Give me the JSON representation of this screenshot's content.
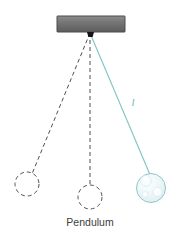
{
  "figure": {
    "caption": "Pendulum",
    "background_color": "#ffffff"
  },
  "support": {
    "name": "support-bar",
    "x": 57,
    "y": 16,
    "width": 68,
    "height": 16,
    "fill_top_color": "#8a8a8a",
    "fill_bottom_color": "#5e5e5e",
    "border_color": "#4d4d4d"
  },
  "pivot": {
    "name": "pivot-point",
    "x": 90,
    "y": 32,
    "width": 7,
    "height": 5,
    "color": "#1a1a1a"
  },
  "strings": {
    "active": {
      "label": "l",
      "color": "#7fc4c4",
      "x1": 90,
      "y1": 33,
      "x2": 151,
      "y2": 178,
      "label_x": 133,
      "label_y": 106
    },
    "ghost_left": {
      "color": "#4f4f4f",
      "dash": "4 3",
      "x1": 90,
      "y1": 33,
      "x2": 32,
      "y2": 174
    },
    "ghost_center": {
      "color": "#4f4f4f",
      "dash": "4 3",
      "x1": 90,
      "y1": 33,
      "x2": 90,
      "y2": 186
    }
  },
  "bobs": {
    "active": {
      "name": "pendulum-bob",
      "cx": 151,
      "cy": 188,
      "r": 14.5,
      "fill_color": "#eaf4f5",
      "stroke_color": "#86c3c6",
      "highlights": [
        {
          "cx": 146,
          "cy": 181,
          "r": 5.5
        },
        {
          "cx": 157,
          "cy": 192,
          "r": 4.5
        },
        {
          "cx": 145,
          "cy": 194,
          "r": 3.0
        }
      ],
      "highlight_color": "#f8fdfd"
    },
    "ghost_left": {
      "name": "pendulum-bob-ghost-left",
      "cx": 27,
      "cy": 184,
      "r": 12,
      "stroke_color": "#555555",
      "dash": "4 3"
    },
    "ghost_center": {
      "name": "pendulum-bob-ghost-center",
      "cx": 90,
      "cy": 197,
      "r": 12,
      "stroke_color": "#555555",
      "dash": "4 3"
    }
  },
  "caption_position": {
    "x": 90,
    "y": 226
  }
}
